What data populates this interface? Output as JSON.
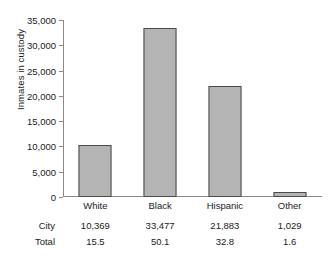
{
  "chart_data": {
    "type": "bar",
    "title": "",
    "subtitle": "",
    "xlabel": "",
    "ylabel": "Inmates in custody",
    "categories": [
      "White",
      "Black",
      "Hispanic",
      "Other"
    ],
    "values": [
      10369,
      33477,
      21883,
      1029
    ],
    "series": [
      {
        "name": "Inmates in custody",
        "values": [
          10369,
          33477,
          21883,
          1029
        ]
      }
    ],
    "ylim": [
      0,
      35000
    ],
    "yticks": [
      0,
      5000,
      10000,
      15000,
      20000,
      25000,
      30000,
      35000
    ],
    "ytick_labels": [
      "0",
      "5,000",
      "10,000",
      "15,000",
      "20,000",
      "25,000",
      "30,000",
      "35,000"
    ],
    "grid": false,
    "legend": false,
    "legend_position": "none",
    "bar_color": "#b4b4b4",
    "bar_edge_color": "#4a4a4a",
    "axis_color": "#8a8a8a",
    "background": "#ffffff",
    "annotations": [],
    "data_table": {
      "row_labels": [
        "City",
        "Total"
      ],
      "columns": [
        "White",
        "Black",
        "Hispanic",
        "Other"
      ],
      "rows": [
        {
          "label": "City",
          "values": [
            "10,369",
            "33,477",
            "21,883",
            "1,029"
          ]
        },
        {
          "label": "Total",
          "values": [
            "15.5",
            "50.1",
            "32.8",
            "1.6"
          ]
        }
      ]
    }
  }
}
